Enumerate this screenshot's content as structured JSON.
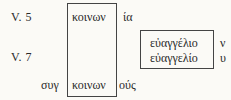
{
  "verses": [
    {
      "label": "V. 5"
    },
    {
      "label": "V. 7"
    }
  ],
  "column_box": {
    "top_word": "κοινων",
    "bottom_word": "κοινων"
  },
  "affixes": {
    "top_suffix": "ία",
    "bottom_prefix": "συγ",
    "bottom_suffix": "ούς"
  },
  "gospel_box": {
    "line1": "εὐαγγέλιο",
    "line2": "εὐαγγελίο",
    "suffix1": "ν",
    "suffix2": "υ"
  },
  "colors": {
    "background": "#fbfaf6",
    "text": "#2a2a2a",
    "border": "#444444"
  }
}
